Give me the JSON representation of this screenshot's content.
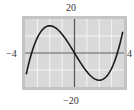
{
  "chart_data": {
    "type": "line",
    "title": "",
    "xlabel": "",
    "ylabel": "",
    "xlim": [
      -4,
      4
    ],
    "ylim": [
      -20,
      20
    ],
    "x_tick_labels": [
      "-4",
      "4"
    ],
    "y_tick_labels": [
      "20",
      "-20"
    ],
    "grid": true,
    "x_grid_step": 1,
    "y_grid_step": 10,
    "function": "x^3 - 12x",
    "series": [
      {
        "name": "f(x)",
        "x": [
          -3.9,
          -3.5,
          -3,
          -2.5,
          -2,
          -1.5,
          -1,
          -0.5,
          0,
          0.5,
          1,
          1.5,
          2,
          2.5,
          3,
          3.5,
          3.9
        ],
        "values": [
          -12.5,
          -0.9,
          9,
          14.4,
          16,
          14.6,
          11,
          5.9,
          0,
          -5.9,
          -11,
          -14.6,
          -16,
          -14.4,
          -9,
          0.9,
          12.5
        ]
      }
    ],
    "colors": {
      "frame": "#b0b0b0",
      "plot_bg": "#d9d9d9",
      "grid": "#f4f4f4",
      "axis": "#555555",
      "curve": "#1a1a1a"
    }
  },
  "labels": {
    "ymax": "20",
    "ymin": "−20",
    "xmin": "−4",
    "xmax": "4"
  }
}
